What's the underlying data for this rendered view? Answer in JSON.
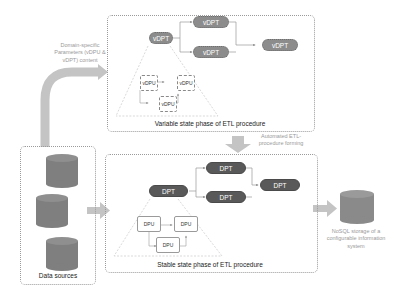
{
  "variable_phase": {
    "caption": "Variable state phase of ETL procedure",
    "main_node": "vDPT",
    "branch_nodes": [
      "vDPT",
      "vDPT"
    ],
    "output_node": "vDPT",
    "units": [
      "vDPU",
      "vDPU",
      "vDPU"
    ]
  },
  "stable_phase": {
    "caption": "Stable state phase of ETL procedure",
    "main_node": "DPT",
    "branch_nodes": [
      "DPT",
      "DPT"
    ],
    "output_node": "DPT",
    "units": [
      "DPU",
      "DPU",
      "DPU"
    ]
  },
  "data_sources": {
    "caption": "Data sources",
    "cylinder_count": 3
  },
  "annotations": {
    "parameters_note": "Domain-specific Parameters (vDPU & vDPT) content",
    "automated_note": "Automated ETL-procedure forming",
    "storage_note": "NoSQL storage of a configurable information system"
  },
  "colors": {
    "variable_node": "#8c8c8c",
    "stable_node": "#595959",
    "cylinder": "#7f7f7f",
    "arrow": "#bfbfbf",
    "panel_border": "#9a9a9a"
  }
}
